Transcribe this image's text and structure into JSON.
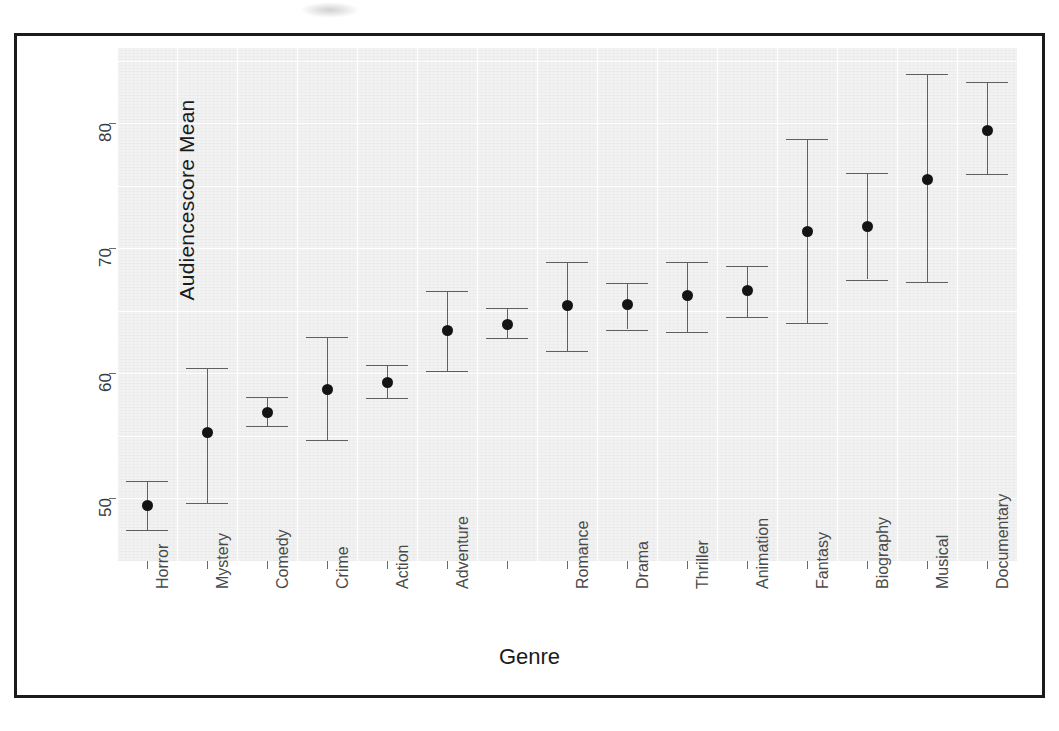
{
  "figure": {
    "x_axis_title": "Genre",
    "y_axis_title": "Audiencescore Mean"
  },
  "chart_data": {
    "type": "scatter",
    "title": "",
    "xlabel": "Genre",
    "ylabel": "Audiencescore Mean",
    "ylim": [
      45,
      86
    ],
    "yticks": [
      50,
      60,
      70,
      80
    ],
    "grid": true,
    "legend": "none",
    "error_bar_type": "95% confidence interval",
    "categories": [
      "Horror",
      "Mystery",
      "Comedy",
      "Crime",
      "Action",
      "Adventure",
      "",
      "Romance",
      "Drama",
      "Thriller",
      "Animation",
      "Fantasy",
      "Biography",
      "Musical",
      "Documentary"
    ],
    "points": [
      {
        "category": "Horror",
        "mean": 49.4,
        "ci_low": 47.5,
        "ci_high": 51.4
      },
      {
        "category": "Mystery",
        "mean": 55.3,
        "ci_low": 49.6,
        "ci_high": 60.4
      },
      {
        "category": "Comedy",
        "mean": 56.9,
        "ci_low": 55.8,
        "ci_high": 58.1
      },
      {
        "category": "Crime",
        "mean": 58.7,
        "ci_low": 54.7,
        "ci_high": 62.9
      },
      {
        "category": "Action",
        "mean": 59.3,
        "ci_low": 58.0,
        "ci_high": 60.7
      },
      {
        "category": "Adventure",
        "mean": 63.4,
        "ci_low": 60.2,
        "ci_high": 66.6
      },
      {
        "category": "",
        "mean": 63.9,
        "ci_low": 62.8,
        "ci_high": 65.2
      },
      {
        "category": "Romance",
        "mean": 65.4,
        "ci_low": 61.8,
        "ci_high": 68.9
      },
      {
        "category": "Drama",
        "mean": 65.5,
        "ci_low": 63.5,
        "ci_high": 67.2
      },
      {
        "category": "Thriller",
        "mean": 66.2,
        "ci_low": 63.3,
        "ci_high": 68.9
      },
      {
        "category": "Animation",
        "mean": 66.6,
        "ci_low": 64.5,
        "ci_high": 68.6
      },
      {
        "category": "Fantasy",
        "mean": 71.3,
        "ci_low": 64.0,
        "ci_high": 78.7
      },
      {
        "category": "Biography",
        "mean": 71.7,
        "ci_low": 67.5,
        "ci_high": 76.0
      },
      {
        "category": "Musical",
        "mean": 75.5,
        "ci_low": 67.3,
        "ci_high": 83.9
      },
      {
        "category": "Documentary",
        "mean": 79.4,
        "ci_low": 75.9,
        "ci_high": 83.3
      }
    ]
  },
  "colors": {
    "frame": "#1b1b1b",
    "plot_background": "#f2f2f2",
    "gridline": "#ffffff",
    "marker": "#131313",
    "error_bar": "#5f5f5f",
    "tick_label": "#4a4a4a"
  }
}
